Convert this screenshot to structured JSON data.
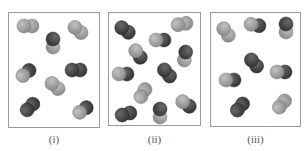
{
  "figure": {
    "panels": [
      {
        "id": "i",
        "label": "(i)",
        "box": {
          "x": 8,
          "y": 12,
          "w": 92,
          "h": 116
        },
        "label_pos": {
          "x": 34,
          "y": 133
        },
        "molecules": [
          {
            "cx": 28,
            "cy": 26,
            "angle": 0,
            "a": "light",
            "b": "light"
          },
          {
            "cx": 78,
            "cy": 30,
            "angle": 40,
            "a": "light",
            "b": "light"
          },
          {
            "cx": 53,
            "cy": 43,
            "angle": 90,
            "a": "dark",
            "b": "light"
          },
          {
            "cx": 26,
            "cy": 73,
            "angle": -40,
            "a": "light",
            "b": "dark"
          },
          {
            "cx": 76,
            "cy": 70,
            "angle": 0,
            "a": "dark",
            "b": "dark"
          },
          {
            "cx": 55,
            "cy": 86,
            "angle": 40,
            "a": "light",
            "b": "light"
          },
          {
            "cx": 30,
            "cy": 107,
            "angle": -45,
            "a": "dark",
            "b": "dark"
          },
          {
            "cx": 83,
            "cy": 110,
            "angle": -35,
            "a": "light",
            "b": "dark"
          }
        ]
      },
      {
        "id": "ii",
        "label": "(ii)",
        "box": {
          "x": 108,
          "y": 12,
          "w": 93,
          "h": 114
        },
        "label_pos": {
          "x": 134,
          "y": 133
        },
        "molecules": [
          {
            "cx": 125,
            "cy": 30,
            "angle": 35,
            "a": "dark",
            "b": "dark"
          },
          {
            "cx": 182,
            "cy": 24,
            "angle": -10,
            "a": "light",
            "b": "light"
          },
          {
            "cx": 160,
            "cy": 40,
            "angle": 0,
            "a": "light",
            "b": "dark"
          },
          {
            "cx": 138,
            "cy": 54,
            "angle": 55,
            "a": "light",
            "b": "dark"
          },
          {
            "cx": 185,
            "cy": 56,
            "angle": 100,
            "a": "dark",
            "b": "light"
          },
          {
            "cx": 123,
            "cy": 74,
            "angle": 0,
            "a": "light",
            "b": "dark"
          },
          {
            "cx": 167,
            "cy": 73,
            "angle": 50,
            "a": "dark",
            "b": "dark"
          },
          {
            "cx": 143,
            "cy": 93,
            "angle": -60,
            "a": "light",
            "b": "light"
          },
          {
            "cx": 186,
            "cy": 104,
            "angle": 35,
            "a": "light",
            "b": "dark"
          },
          {
            "cx": 126,
            "cy": 114,
            "angle": -15,
            "a": "dark",
            "b": "dark"
          },
          {
            "cx": 160,
            "cy": 113,
            "angle": 90,
            "a": "dark",
            "b": "light"
          }
        ]
      },
      {
        "id": "iii",
        "label": "(iii)",
        "box": {
          "x": 210,
          "y": 12,
          "w": 91,
          "h": 115
        },
        "label_pos": {
          "x": 236,
          "y": 133
        },
        "molecules": [
          {
            "cx": 226,
            "cy": 32,
            "angle": 55,
            "a": "light",
            "b": "light"
          },
          {
            "cx": 255,
            "cy": 25,
            "angle": 10,
            "a": "light",
            "b": "dark"
          },
          {
            "cx": 286,
            "cy": 28,
            "angle": 90,
            "a": "dark",
            "b": "light"
          },
          {
            "cx": 254,
            "cy": 63,
            "angle": 50,
            "a": "dark",
            "b": "dark"
          },
          {
            "cx": 230,
            "cy": 80,
            "angle": 0,
            "a": "light",
            "b": "dark"
          },
          {
            "cx": 281,
            "cy": 72,
            "angle": 0,
            "a": "light",
            "b": "dark"
          },
          {
            "cx": 240,
            "cy": 107,
            "angle": -50,
            "a": "dark",
            "b": "dark"
          },
          {
            "cx": 282,
            "cy": 104,
            "angle": -50,
            "a": "light",
            "b": "light"
          }
        ]
      }
    ],
    "colors": {
      "dark": "#4a4a4a",
      "dark_edge": "#2e2e2e",
      "light": "#a3a3a3",
      "light_edge": "#7d7d7d",
      "border": "#9a9a9a",
      "label": "#555555"
    },
    "atom_radius": 7,
    "atom_separation": 8
  }
}
